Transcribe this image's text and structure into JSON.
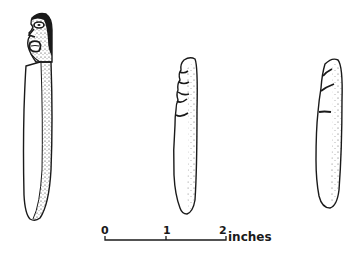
{
  "figure": {
    "artifacts": [
      {
        "id": "artifact-1",
        "label": "carved effigy pestle with human face",
        "features": [
          "carved-head",
          "stippled-side"
        ]
      },
      {
        "id": "artifact-2",
        "label": "notched elongated stone",
        "features": [
          "notches",
          "stippled-edge"
        ]
      },
      {
        "id": "artifact-3",
        "label": "notched elongated stone",
        "features": [
          "notches",
          "stippled-edge"
        ]
      }
    ],
    "scale_bar": {
      "ticks": [
        "0",
        "1",
        "2"
      ],
      "units": "inches"
    },
    "colors": {
      "ink": "#1a1a1a",
      "background": "#ffffff"
    }
  }
}
